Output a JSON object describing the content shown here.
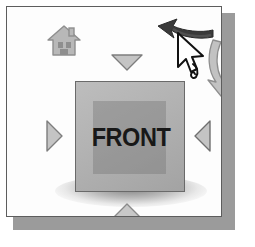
{
  "widget": {
    "name": "ViewCube navigation widget",
    "face_label": "FRONT"
  },
  "panel": {
    "background_color": "#fdfdfd",
    "border_color": "#5d5d5d",
    "shadow_color": "#9b9b9b"
  },
  "cube": {
    "face_label": "FRONT",
    "face_color": "#b2b2b2",
    "border_color": "#6a6a6a",
    "inner_patch_color": "#787878",
    "label_color": "#181818"
  },
  "controls": {
    "home": {
      "label": "Home",
      "icon": "home-icon",
      "color": "#b6b6b6"
    },
    "rotate_counterclockwise": {
      "label": "Rotate counterclockwise",
      "icon": "rotate-ccw-arrow-icon",
      "color": "#3a3a3a"
    },
    "rotate_clockwise": {
      "label": "Rotate clockwise",
      "icon": "rotate-cw-arrow-icon",
      "color": "#bdbdbd"
    },
    "cursor": {
      "label": "Mouse pointer",
      "icon": "mouse-pointer-icon",
      "color": "#ffffff"
    }
  },
  "nav_arrows": [
    {
      "id": "top",
      "label": "Rotate up",
      "icon": "triangle-down-icon",
      "direction": "down",
      "color": "#c0c0c0"
    },
    {
      "id": "left",
      "label": "Rotate left",
      "icon": "triangle-right-icon",
      "direction": "right",
      "color": "#c0c0c0"
    },
    {
      "id": "right",
      "label": "Rotate right",
      "icon": "triangle-left-icon",
      "direction": "left",
      "color": "#c0c0c0"
    },
    {
      "id": "bottom",
      "label": "Rotate down",
      "icon": "triangle-up-icon",
      "direction": "up",
      "color": "#c0c0c0"
    }
  ]
}
